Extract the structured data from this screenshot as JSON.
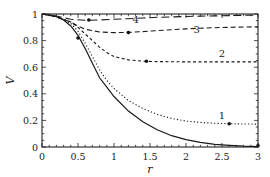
{
  "chart_data": {
    "type": "line",
    "title": "",
    "xlabel": "r",
    "ylabel": "V",
    "xlim": [
      0,
      3
    ],
    "ylim": [
      0,
      1
    ],
    "grid": false,
    "legend": "none (curves labeled inline)",
    "x_ticks": [
      "0",
      "0.5",
      "1",
      "1.5",
      "2",
      "2.5",
      "3"
    ],
    "y_ticks": [
      "0",
      "0.2",
      "0.4",
      "0.6",
      "0.8",
      "1"
    ],
    "series": [
      {
        "name": "solid",
        "style": "solid",
        "x": [
          0,
          0.1,
          0.2,
          0.3,
          0.4,
          0.5,
          0.6,
          0.7,
          0.8,
          0.9,
          1.0,
          1.2,
          1.4,
          1.6,
          1.8,
          2.0,
          2.2,
          2.4,
          2.6,
          2.8,
          3.0
        ],
        "y": [
          1.0,
          0.995,
          0.98,
          0.955,
          0.91,
          0.84,
          0.74,
          0.63,
          0.52,
          0.45,
          0.38,
          0.27,
          0.19,
          0.13,
          0.085,
          0.055,
          0.035,
          0.02,
          0.012,
          0.006,
          0.003
        ],
        "marker": {
          "x": 3.0,
          "y": 0.01
        }
      },
      {
        "name": "1",
        "style": "dotted",
        "x": [
          0,
          0.2,
          0.4,
          0.5,
          0.6,
          0.7,
          0.8,
          0.9,
          1.0,
          1.2,
          1.4,
          1.6,
          1.8,
          2.0,
          2.2,
          2.4,
          2.6,
          2.8,
          3.0
        ],
        "y": [
          1.0,
          0.98,
          0.93,
          0.87,
          0.78,
          0.68,
          0.58,
          0.5,
          0.44,
          0.35,
          0.29,
          0.245,
          0.215,
          0.195,
          0.185,
          0.178,
          0.175,
          0.173,
          0.172
        ],
        "marker": {
          "x": 2.6,
          "y": 0.175
        },
        "label_pos": {
          "x": 2.5,
          "y": 0.21
        }
      },
      {
        "name": "2",
        "style": "dash-dot (short dashes)",
        "x": [
          0,
          0.2,
          0.4,
          0.5,
          0.6,
          0.7,
          0.8,
          0.9,
          1.0,
          1.2,
          1.4,
          1.6,
          1.8,
          2.0,
          2.2,
          2.4,
          2.6,
          2.8,
          3.0
        ],
        "y": [
          1.0,
          0.98,
          0.94,
          0.9,
          0.85,
          0.8,
          0.75,
          0.71,
          0.68,
          0.655,
          0.645,
          0.642,
          0.641,
          0.64,
          0.64,
          0.64,
          0.64,
          0.64,
          0.64
        ],
        "marker": {
          "x": 1.45,
          "y": 0.645
        },
        "label_pos": {
          "x": 2.5,
          "y": 0.68
        }
      },
      {
        "name": "3",
        "style": "dashed",
        "x": [
          0,
          0.2,
          0.4,
          0.5,
          0.6,
          0.8,
          1.0,
          1.2,
          1.4,
          1.6,
          1.8,
          2.0,
          2.2,
          2.4,
          2.6,
          2.8,
          3.0
        ],
        "y": [
          1.0,
          0.98,
          0.94,
          0.91,
          0.885,
          0.865,
          0.86,
          0.862,
          0.868,
          0.875,
          0.882,
          0.888,
          0.893,
          0.897,
          0.9,
          0.902,
          0.904
        ],
        "marker": {
          "x": 0.5,
          "y": 0.82
        },
        "marker2": {
          "x": 1.2,
          "y": 0.86
        },
        "label_pos": {
          "x": 2.15,
          "y": 0.86
        }
      },
      {
        "name": "4",
        "style": "long-dashed",
        "x": [
          0,
          0.2,
          0.4,
          0.6,
          0.8,
          1.0,
          1.2,
          1.4,
          1.6,
          1.8,
          2.0,
          2.2,
          2.4,
          2.6,
          2.8,
          3.0
        ],
        "y": [
          1.0,
          0.985,
          0.96,
          0.953,
          0.955,
          0.96,
          0.965,
          0.97,
          0.975,
          0.978,
          0.981,
          0.984,
          0.986,
          0.988,
          0.99,
          0.991
        ],
        "marker": {
          "x": 0.65,
          "y": 0.955
        },
        "label_pos": {
          "x": 1.3,
          "y": 0.93
        }
      }
    ]
  }
}
